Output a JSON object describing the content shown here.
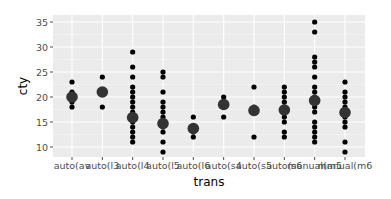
{
  "chart_data": {
    "type": "scatter",
    "title": "",
    "xlabel": "trans",
    "ylabel": "cty",
    "categories": [
      "auto(av)",
      "auto(l3)",
      "auto(l4)",
      "auto(l5)",
      "auto(l6)",
      "auto(s4)",
      "auto(s5)",
      "auto(s6)",
      "manual(m5)",
      "manual(m6)"
    ],
    "tick_labels_display": [
      "auto(av",
      "auto(l3",
      "auto(l4",
      "auto(l5",
      "auto(l6",
      "auto(s4",
      "auto(s5",
      "auto(s6",
      "manual(m5",
      "manual(m6"
    ],
    "yticks": [
      10,
      15,
      20,
      25,
      30,
      35
    ],
    "ylim": [
      7.5,
      36.5
    ],
    "grid": true,
    "legend": "none",
    "series": [
      {
        "name": "observations",
        "marker": "small-dot",
        "points": {
          "auto(av)": [
            18,
            19,
            20,
            21,
            23
          ],
          "auto(l3)": [
            18,
            21,
            24
          ],
          "auto(l4)": [
            11,
            12,
            13,
            14,
            15,
            16,
            17,
            18,
            19,
            20,
            21,
            22,
            24,
            26,
            29
          ],
          "auto(l5)": [
            9,
            11,
            13,
            14,
            15,
            16,
            17,
            18,
            19,
            21,
            24,
            25
          ],
          "auto(l6)": [
            12,
            13,
            14,
            16
          ],
          "auto(s4)": [
            16,
            18,
            19,
            20
          ],
          "auto(s5)": [
            12,
            17,
            18,
            22
          ],
          "auto(s6)": [
            12,
            13,
            15,
            16,
            17,
            18,
            19,
            20,
            21,
            22
          ],
          "manual(m5)": [
            11,
            12,
            13,
            14,
            15,
            17,
            18,
            19,
            20,
            21,
            22,
            24,
            26,
            27,
            28,
            33,
            35
          ],
          "manual(m6)": [
            9,
            11,
            14,
            15,
            16,
            17,
            18,
            19,
            20,
            21,
            23
          ]
        }
      },
      {
        "name": "mean",
        "marker": "large-dot",
        "values": [
          20.0,
          21.0,
          15.9,
          14.7,
          13.7,
          18.5,
          17.3,
          17.4,
          19.3,
          16.9
        ]
      }
    ]
  },
  "colors": {
    "panel_bg": "#ebebeb",
    "grid_major": "#ffffff",
    "grid_minor": "#f5f5f5",
    "point": "#000000",
    "mean_point": "#333333",
    "tick": "#4d4d4d"
  }
}
